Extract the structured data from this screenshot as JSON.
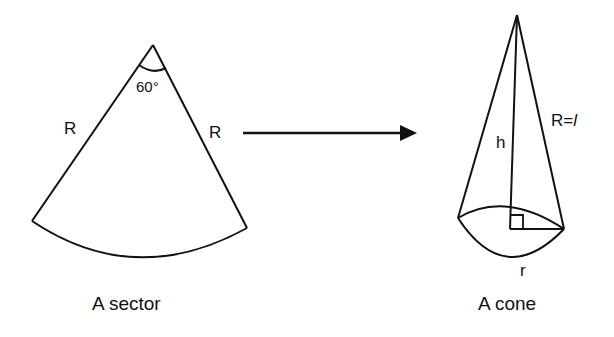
{
  "sector": {
    "caption": "A sector",
    "angle_label": "60°",
    "left_side_label": "R",
    "right_side_label": "R"
  },
  "cone": {
    "caption": "A cone",
    "height_label": "h",
    "slant_label_prefix": "R=",
    "slant_label_var": "l",
    "radius_label": "r"
  },
  "arrow": {
    "direction": "right"
  },
  "colors": {
    "stroke": "#111111",
    "background": "#ffffff"
  }
}
